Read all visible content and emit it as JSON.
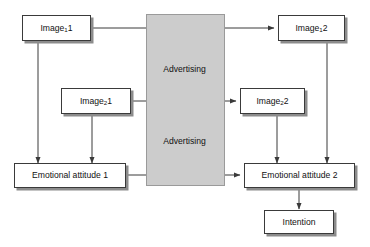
{
  "diagram": {
    "background_color": "#ffffff",
    "band_color": "#cccccc",
    "line_color": "#3a3a3a",
    "shadow_color": "#8c8c8c",
    "band": {
      "label_top": "Advertising",
      "label_bottom": "Advertising"
    },
    "nodes": [
      {
        "id": "image-1-1",
        "text_main": "Image",
        "text_sub": "1",
        "text_tail": "1"
      },
      {
        "id": "image-1-2",
        "text_main": "Image",
        "text_sub": "1",
        "text_tail": "2"
      },
      {
        "id": "image-2-1",
        "text_main": "Image",
        "text_sub": "2",
        "text_tail": "1"
      },
      {
        "id": "image-2-2",
        "text_main": "Image",
        "text_sub": "2",
        "text_tail": "2"
      },
      {
        "id": "emotional-attitude-1",
        "text_main": "Emotional attitude 1",
        "text_sub": "",
        "text_tail": ""
      },
      {
        "id": "emotional-attitude-2",
        "text_main": "Emotional attitude 2",
        "text_sub": "",
        "text_tail": ""
      },
      {
        "id": "intention",
        "text_main": "Intention",
        "text_sub": "",
        "text_tail": ""
      }
    ]
  }
}
